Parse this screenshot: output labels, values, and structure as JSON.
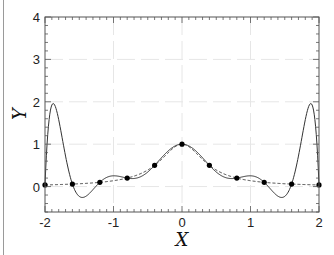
{
  "chart_data": {
    "type": "line",
    "title": "",
    "xlabel": "X",
    "ylabel": "Y",
    "xlim": [
      -2,
      2
    ],
    "ylim": [
      -0.6,
      4
    ],
    "xticks": [
      -2,
      -1,
      0,
      1,
      2
    ],
    "xtick_labels": [
      "-2",
      "-1",
      "0",
      "1",
      "2"
    ],
    "yticks": [
      0,
      1,
      2,
      3,
      4
    ],
    "ytick_labels": [
      "0",
      "1",
      "2",
      "3",
      "4"
    ],
    "grid": true,
    "legend": null,
    "series": [
      {
        "name": "f(x) = 1/(1+25x²) scaled to [-2,2]",
        "style": "dashed",
        "color": "#333333",
        "function": "1/(1+(25/4)*x^2)"
      },
      {
        "name": "degree-10 polynomial interpolant",
        "style": "solid",
        "color": "#333333",
        "peak_values": [
          {
            "x": -1.9,
            "y": 3.55
          },
          {
            "x": 1.9,
            "y": 3.55
          }
        ],
        "minimum_values": [
          {
            "x": -1.4,
            "y": -0.5
          },
          {
            "x": 1.4,
            "y": -0.5
          }
        ]
      },
      {
        "name": "interpolation nodes",
        "style": "markers",
        "color": "#000000",
        "x": [
          -2,
          -1.6,
          -1.2,
          -0.8,
          -0.4,
          0,
          0.4,
          0.8,
          1.2,
          1.6,
          2
        ],
        "y": [
          0.038,
          0.059,
          0.1,
          0.2,
          0.5,
          1.0,
          0.5,
          0.2,
          0.1,
          0.059,
          0.038
        ]
      }
    ]
  },
  "labels": {
    "x_axis_title": "X",
    "y_axis_title": "Y"
  }
}
